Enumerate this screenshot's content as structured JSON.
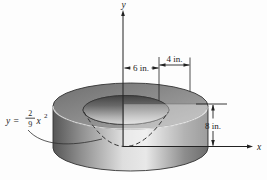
{
  "figure": {
    "axis_labels": {
      "x": "x",
      "y": "y"
    },
    "equation": {
      "lhs": "y",
      "eq": "=",
      "num": "2",
      "den": "9",
      "variable": "x",
      "exponent": "2"
    },
    "dimensions": {
      "inner_radius": "6 in.",
      "ring_width": "4 in.",
      "height": "8 in."
    },
    "colors": {
      "line": "#2a2a2a",
      "surface_dark": "#525252",
      "surface_mid": "#8e8e8e",
      "surface_light": "#e0e0e0",
      "background": "#fdfdfd"
    }
  }
}
